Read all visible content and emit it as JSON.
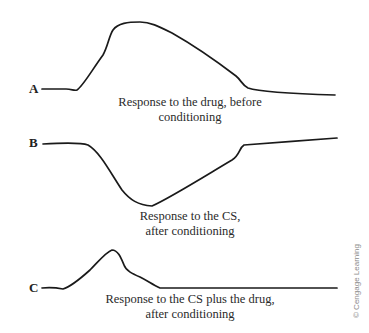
{
  "figure": {
    "panels": [
      {
        "id": "A",
        "label": "A",
        "caption_line1": "Response to the drug, before",
        "caption_line2": "conditioning",
        "curve": "M42,89 L66,89 C72,89 74,91 77,90 C83,86 92,70 103,55 C108,46 109,36 113,30 C118,23 128,22 140,22 C150,22 158,26 172,33 C195,46 215,60 236,76 C241,80 242,85 248,88 C260,92 300,94 335,95"
      },
      {
        "id": "B",
        "label": "B",
        "caption_line1": "Response to the CS,",
        "caption_line2": "after conditioning",
        "curve": "M43,144 C60,143 80,142 88,145 C100,152 110,172 122,190 C130,200 138,205 152,206 C170,198 205,176 232,160 C240,155 239,148 244,145 C270,143 310,140 337,138"
      },
      {
        "id": "C",
        "label": "C",
        "caption_line1": "Response to the CS plus the drug,",
        "caption_line2": "after conditioning",
        "curve": "M42,288 C50,287 58,288 63,289 C70,287 80,279 90,270 C98,262 106,252 112,250 C118,250 121,258 124,265 C126,271 133,274 140,277 C148,281 153,285 160,288 C200,288 280,288 337,288"
      }
    ],
    "copyright": "© Cengage Learning"
  }
}
